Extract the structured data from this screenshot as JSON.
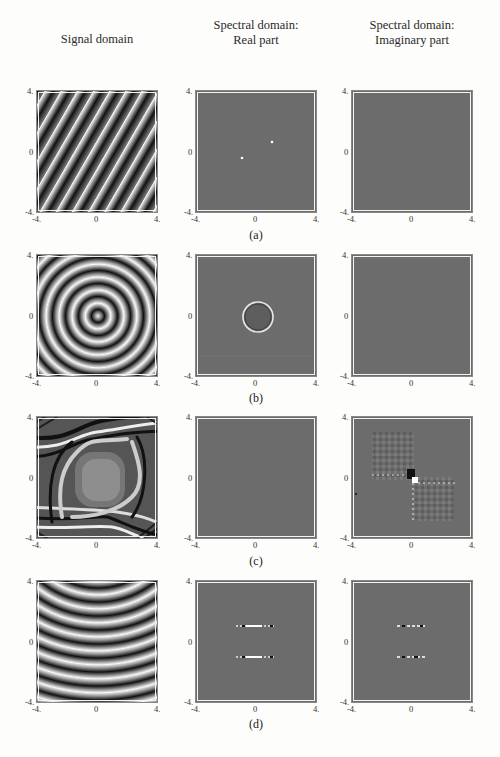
{
  "header": {
    "col_signal": "Signal domain",
    "col_real_1": "Spectral domain:",
    "col_real_2": "Real part",
    "col_imag_1": "Spectral domain:",
    "col_imag_2": "Imaginary part"
  },
  "axes": {
    "min": "-4.",
    "mid": "0",
    "max": "4."
  },
  "rows": [
    {
      "caption": "(a)",
      "signal": "diagonal-stripes",
      "real": "two-point-peaks",
      "imag": "flat-zero"
    },
    {
      "caption": "(b)",
      "signal": "concentric-rings",
      "real": "ring-spectrum",
      "imag": "flat-zero"
    },
    {
      "caption": "(c)",
      "signal": "hyperbolic-fringes",
      "real": "flat-zero",
      "imag": "checkerboard-cross"
    },
    {
      "caption": "(d)",
      "signal": "parabolic-arcs",
      "real": "two-horizontal-lines",
      "imag": "two-horizontal-lines"
    }
  ],
  "colors": {
    "spectral_bg": "#6c6c6c",
    "page_bg": "#fdfdfb"
  }
}
